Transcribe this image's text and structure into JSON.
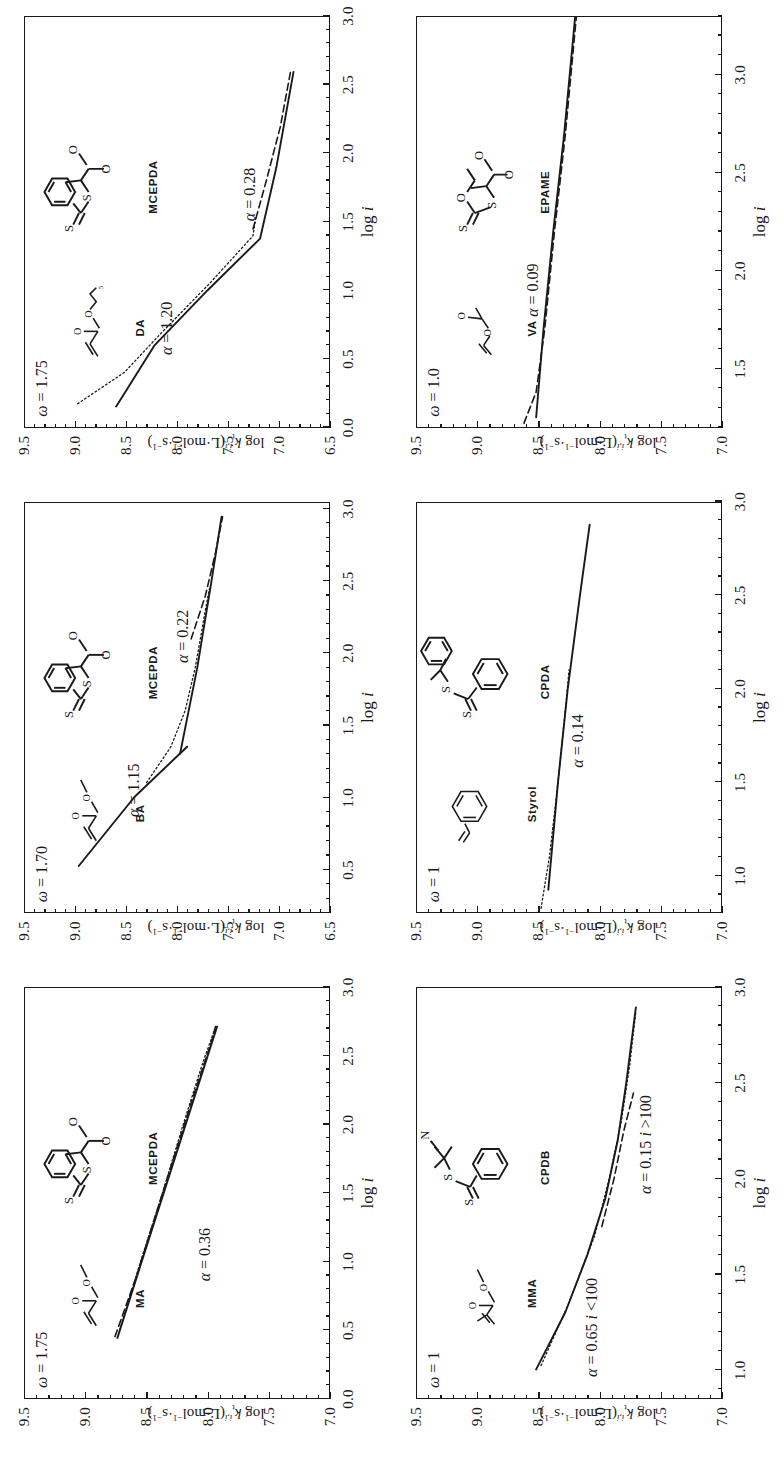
{
  "figure": {
    "orientation": "rotated-90-ccw",
    "n_panels": 6,
    "axis_title_x": "log i",
    "axis_title_y": "log k_t^{i,i} (L·mol^-1·s^-1)",
    "axis_title_y_parts": {
      "log": "log",
      "k": "k",
      "sub": "t",
      "sup": "i,i",
      "units": "(L·mol",
      "units_sup1": "-1",
      "units_mid": "·s",
      "units_sup2": "-1",
      "units_close": ")"
    }
  },
  "chart_data": [
    {
      "id": "panel-ma",
      "type": "line",
      "title": "MA / MCEPDA",
      "xlabel": "log i",
      "ylabel": "log k_t^{i,i} (L·mol^-1·s^-1)",
      "xlim": [
        0.0,
        3.0
      ],
      "ylim": [
        7.0,
        9.5
      ],
      "xticks": [
        "0.0",
        "0.5",
        "1.0",
        "1.5",
        "2.0",
        "2.5",
        "3.0"
      ],
      "xtick_values": [
        0.0,
        0.5,
        1.0,
        1.5,
        2.0,
        2.5,
        3.0
      ],
      "yticks": [
        "7.0",
        "7.5",
        "8.0",
        "8.5",
        "9.0",
        "9.5"
      ],
      "ytick_values": [
        7.0,
        7.5,
        8.0,
        8.5,
        9.0,
        9.5
      ],
      "grid": false,
      "legend": "none",
      "omega_label": "ω = 1.75",
      "omega_value": 1.75,
      "annotations": [
        {
          "text": "α = 0.36",
          "alpha": 0.36,
          "x": 1.05,
          "y": 8.02
        }
      ],
      "monomer": "MA",
      "raft_agent": "MCEPDA",
      "series": [
        {
          "name": "solid fit",
          "style": "solid",
          "points": [
            [
              0.44,
              8.74
            ],
            [
              1.0,
              8.54
            ],
            [
              1.5,
              8.36
            ],
            [
              2.0,
              8.18
            ],
            [
              2.5,
              8.0
            ],
            [
              2.72,
              7.92
            ]
          ]
        },
        {
          "name": "dashed data",
          "style": "dashed",
          "points": [
            [
              0.45,
              8.76
            ],
            [
              0.9,
              8.58
            ],
            [
              1.3,
              8.44
            ],
            [
              1.75,
              8.28
            ],
            [
              2.2,
              8.12
            ],
            [
              2.6,
              7.97
            ],
            [
              2.73,
              7.93
            ]
          ]
        },
        {
          "name": "dotted data",
          "style": "dotted",
          "points": [
            [
              0.5,
              8.72
            ],
            [
              1.0,
              8.55
            ],
            [
              1.5,
              8.37
            ],
            [
              2.0,
              8.2
            ],
            [
              2.45,
              8.04
            ],
            [
              2.7,
              7.94
            ]
          ]
        }
      ]
    },
    {
      "id": "panel-ba",
      "type": "line",
      "title": "BA / MCEPDA",
      "xlabel": "log i",
      "ylabel": "log k_t^{i,i} (L·mol^-1·s^-1)",
      "xlim": [
        0.2,
        3.05
      ],
      "ylim": [
        6.5,
        9.5
      ],
      "xticks": [
        "0.5",
        "1.0",
        "1.5",
        "2.0",
        "2.5",
        "3.0"
      ],
      "xtick_values": [
        0.5,
        1.0,
        1.5,
        2.0,
        2.5,
        3.0
      ],
      "yticks": [
        "6.5",
        "7.0",
        "7.5",
        "8.0",
        "8.5",
        "9.0",
        "9.5"
      ],
      "ytick_values": [
        6.5,
        7.0,
        7.5,
        8.0,
        8.5,
        9.0,
        9.5
      ],
      "grid": false,
      "legend": "none",
      "omega_label": "ω = 1.70",
      "omega_value": 1.7,
      "annotations": [
        {
          "text": "α = 1.15",
          "alpha": 1.15,
          "x": 1.05,
          "y": 8.42
        },
        {
          "text": "α = 0.22",
          "alpha": 0.22,
          "x": 2.12,
          "y": 7.94
        }
      ],
      "monomer": "BA",
      "raft_agent": "MCEPDA",
      "series": [
        {
          "name": "solid segment low-i",
          "style": "solid",
          "points": [
            [
              0.52,
              8.97
            ],
            [
              1.0,
              8.42
            ],
            [
              1.35,
              7.9
            ]
          ]
        },
        {
          "name": "solid segment high-i",
          "style": "solid",
          "points": [
            [
              1.3,
              7.97
            ],
            [
              1.9,
              7.8
            ],
            [
              2.5,
              7.66
            ],
            [
              2.95,
              7.56
            ]
          ]
        },
        {
          "name": "dotted data",
          "style": "dotted",
          "points": [
            [
              1.1,
              8.3
            ],
            [
              1.35,
              8.06
            ],
            [
              1.6,
              7.92
            ],
            [
              1.9,
              7.82
            ],
            [
              2.3,
              7.72
            ],
            [
              2.45,
              7.68
            ]
          ]
        },
        {
          "name": "dashed data",
          "style": "dashed",
          "points": [
            [
              2.1,
              7.86
            ],
            [
              2.4,
              7.72
            ],
            [
              2.7,
              7.62
            ],
            [
              2.95,
              7.55
            ]
          ]
        }
      ]
    },
    {
      "id": "panel-da",
      "type": "line",
      "title": "DA / MCEPDA",
      "xlabel": "log i",
      "ylabel": "log k_t^{i,i} (L·mol^-1·s^-1)",
      "xlim": [
        0.0,
        3.0
      ],
      "ylim": [
        6.5,
        9.5
      ],
      "xticks": [
        "0.0",
        "0.5",
        "1.0",
        "1.5",
        "2.0",
        "2.5",
        "3.0"
      ],
      "xtick_values": [
        0.0,
        0.5,
        1.0,
        1.5,
        2.0,
        2.5,
        3.0
      ],
      "yticks": [
        "6.5",
        "7.0",
        "7.5",
        "8.0",
        "8.5",
        "9.0",
        "9.5"
      ],
      "ytick_values": [
        6.5,
        7.0,
        7.5,
        8.0,
        8.5,
        9.0,
        9.5
      ],
      "grid": false,
      "legend": "none",
      "omega_label": "ω = 1.75",
      "omega_value": 1.75,
      "annotations": [
        {
          "text": "α = 1.20",
          "alpha": 1.2,
          "x": 0.72,
          "y": 8.1
        },
        {
          "text": "α = 0.28",
          "alpha": 0.28,
          "x": 1.7,
          "y": 7.28
        }
      ],
      "monomer": "DA",
      "raft_agent": "MCEPDA",
      "series": [
        {
          "name": "solid fit",
          "style": "solid",
          "points": [
            [
              0.15,
              8.6
            ],
            [
              0.6,
              8.22
            ],
            [
              1.0,
              7.7
            ],
            [
              1.38,
              7.18
            ],
            [
              1.9,
              7.02
            ],
            [
              2.6,
              6.85
            ]
          ]
        },
        {
          "name": "dashed data",
          "style": "dashed",
          "points": [
            [
              1.45,
              7.25
            ],
            [
              1.8,
              7.12
            ],
            [
              2.2,
              6.98
            ],
            [
              2.6,
              6.88
            ]
          ]
        },
        {
          "name": "dotted data",
          "style": "dotted",
          "points": [
            [
              0.17,
              8.98
            ],
            [
              0.4,
              8.52
            ],
            [
              0.7,
              8.14
            ],
            [
              1.05,
              7.68
            ],
            [
              1.4,
              7.25
            ],
            [
              1.55,
              7.22
            ]
          ]
        }
      ]
    },
    {
      "id": "panel-mma",
      "type": "line",
      "title": "MMA / CPDB",
      "xlabel": "log i",
      "ylabel": "log k_t^{i,i} (L·mol^-1·s^-1)",
      "xlim": [
        0.85,
        3.0
      ],
      "ylim": [
        7.0,
        9.5
      ],
      "xticks": [
        "1.0",
        "1.5",
        "2.0",
        "2.5",
        "3.0"
      ],
      "xtick_values": [
        1.0,
        1.5,
        2.0,
        2.5,
        3.0
      ],
      "yticks": [
        "7.0",
        "7.5",
        "8.0",
        "8.5",
        "9.0",
        "9.5"
      ],
      "ytick_values": [
        7.0,
        7.5,
        8.0,
        8.5,
        9.0,
        9.5
      ],
      "grid": false,
      "legend": "none",
      "omega_label": "ω = 1",
      "omega_value": 1,
      "annotations": [
        {
          "text": "α = 0.65 i <100",
          "alpha": 0.65,
          "x": 1.22,
          "y": 8.06
        },
        {
          "text": "α = 0.15 i >100",
          "alpha": 0.15,
          "x": 2.18,
          "y": 7.62
        }
      ],
      "monomer": "MMA",
      "raft_agent": "CPDB",
      "series": [
        {
          "name": "solid fit",
          "style": "solid",
          "points": [
            [
              1.0,
              8.52
            ],
            [
              1.3,
              8.28
            ],
            [
              1.6,
              8.1
            ],
            [
              1.9,
              7.95
            ],
            [
              2.2,
              7.85
            ],
            [
              2.5,
              7.78
            ],
            [
              2.9,
              7.7
            ]
          ]
        },
        {
          "name": "dotted data",
          "style": "dotted",
          "points": [
            [
              1.02,
              8.48
            ],
            [
              1.35,
              8.25
            ],
            [
              1.7,
              8.04
            ],
            [
              2.0,
              7.92
            ],
            [
              2.3,
              7.82
            ],
            [
              2.6,
              7.75
            ],
            [
              2.88,
              7.7
            ]
          ]
        },
        {
          "name": "dashed data",
          "style": "dashed",
          "points": [
            [
              1.75,
              7.98
            ],
            [
              2.0,
              7.88
            ],
            [
              2.25,
              7.8
            ],
            [
              2.45,
              7.72
            ]
          ]
        }
      ]
    },
    {
      "id": "panel-styrol",
      "type": "line",
      "title": "Styrol / CPDA",
      "xlabel": "log i",
      "ylabel": "log k_t^{i,i} (L·mol^-1·s^-1)",
      "xlim": [
        0.8,
        3.0
      ],
      "ylim": [
        7.0,
        9.5
      ],
      "xticks": [
        "1.0",
        "1.5",
        "2.0",
        "2.5",
        "3.0"
      ],
      "xtick_values": [
        1.0,
        1.5,
        2.0,
        2.5,
        3.0
      ],
      "yticks": [
        "7.0",
        "7.5",
        "8.0",
        "8.5",
        "9.0",
        "9.5"
      ],
      "ytick_values": [
        7.0,
        7.5,
        8.0,
        8.5,
        9.0,
        9.5
      ],
      "grid": false,
      "legend": "none",
      "omega_label": "ω = 1",
      "omega_value": 1,
      "annotations": [
        {
          "text": "α = 0.14",
          "alpha": 0.14,
          "x": 1.72,
          "y": 8.18
        }
      ],
      "monomer": "Styrol",
      "raft_agent": "CPDA",
      "series": [
        {
          "name": "solid fit",
          "style": "solid",
          "points": [
            [
              0.92,
              8.42
            ],
            [
              1.5,
              8.34
            ],
            [
              2.0,
              8.26
            ],
            [
              2.5,
              8.16
            ],
            [
              2.88,
              8.08
            ]
          ]
        },
        {
          "name": "dotted data",
          "style": "dotted",
          "points": [
            [
              0.82,
              8.48
            ],
            [
              1.1,
              8.41
            ],
            [
              1.5,
              8.34
            ],
            [
              1.95,
              8.27
            ],
            [
              2.1,
              8.25
            ]
          ]
        }
      ]
    },
    {
      "id": "panel-va",
      "type": "line",
      "title": "VA / EPAME",
      "xlabel": "log i",
      "ylabel": "log k_t^{i,i} (L·mol^-1·s^-1)",
      "xlim": [
        1.2,
        3.3
      ],
      "ylim": [
        7.0,
        9.5
      ],
      "xticks": [
        "1.5",
        "2.0",
        "2.5",
        "3.0"
      ],
      "xtick_values": [
        1.5,
        2.0,
        2.5,
        3.0
      ],
      "yticks": [
        "7.0",
        "7.5",
        "8.0",
        "8.5",
        "9.0",
        "9.5"
      ],
      "ytick_values": [
        7.0,
        7.5,
        8.0,
        8.5,
        9.0,
        9.5
      ],
      "grid": false,
      "legend": "none",
      "omega_label": "ω = 1.0",
      "omega_value": 1.0,
      "annotations": [
        {
          "text": "α = 0.09",
          "alpha": 0.09,
          "x": 1.9,
          "y": 8.55
        }
      ],
      "monomer": "VA",
      "raft_agent": "EPAME",
      "series": [
        {
          "name": "solid fit",
          "style": "solid",
          "points": [
            [
              1.25,
              8.52
            ],
            [
              1.7,
              8.46
            ],
            [
              2.2,
              8.38
            ],
            [
              2.7,
              8.29
            ],
            [
              3.3,
              8.2
            ]
          ]
        },
        {
          "name": "dashed data",
          "style": "dashed",
          "points": [
            [
              1.22,
              8.62
            ],
            [
              1.38,
              8.52
            ],
            [
              1.7,
              8.45
            ],
            [
              2.2,
              8.37
            ],
            [
              2.7,
              8.28
            ],
            [
              3.3,
              8.19
            ]
          ]
        }
      ]
    }
  ],
  "panels": [
    {
      "id": "panel-ma",
      "monomer_label": "MA",
      "raft_label": "MCEPDA",
      "omega": "ω = 1.75",
      "alpha_texts": [
        "α = 0.36"
      ]
    },
    {
      "id": "panel-ba",
      "monomer_label": "BA",
      "raft_label": "MCEPDA",
      "omega": "ω = 1.70",
      "alpha_texts": [
        "α = 1.15",
        "α = 0.22"
      ]
    },
    {
      "id": "panel-da",
      "monomer_label": "DA",
      "raft_label": "MCEPDA",
      "omega": "ω = 1.75",
      "alpha_texts": [
        "α = 1.20",
        "α = 0.28"
      ]
    },
    {
      "id": "panel-mma",
      "monomer_label": "MMA",
      "raft_label": "CPDB",
      "omega": "ω = 1",
      "alpha_texts": [
        "α = 0.65 i <100",
        "α = 0.15 i >100"
      ]
    },
    {
      "id": "panel-styrol",
      "monomer_label": "Styrol",
      "raft_label": "CPDA",
      "omega": "ω = 1",
      "alpha_texts": [
        "α = 0.14"
      ]
    },
    {
      "id": "panel-va",
      "monomer_label": "VA",
      "raft_label": "EPAME",
      "omega": "ω = 1.0",
      "alpha_texts": [
        "α = 0.09"
      ]
    }
  ],
  "structures": {
    "MA": {
      "atoms": [
        "O",
        "O"
      ],
      "name": "MA"
    },
    "BA": {
      "atoms": [
        "O",
        "O"
      ],
      "name": "BA"
    },
    "DA": {
      "atoms": [
        "O",
        "O"
      ],
      "subscript": "5",
      "name": "DA"
    },
    "MMA": {
      "atoms": [
        "O",
        "O"
      ],
      "name": "MMA"
    },
    "Styrol": {
      "atoms": [],
      "name": "Styrol"
    },
    "VA": {
      "atoms": [
        "O",
        "O"
      ],
      "name": "VA"
    },
    "MCEPDA": {
      "atoms": [
        "S",
        "S",
        "O",
        "O"
      ],
      "name": "MCEPDA"
    },
    "CPDB": {
      "atoms": [
        "S",
        "S",
        "N"
      ],
      "name": "CPDB"
    },
    "CPDA": {
      "atoms": [
        "S",
        "S"
      ],
      "name": "CPDA"
    },
    "EPAME": {
      "atoms": [
        "S",
        "S",
        "O",
        "O",
        "O"
      ],
      "name": "EPAME"
    }
  }
}
